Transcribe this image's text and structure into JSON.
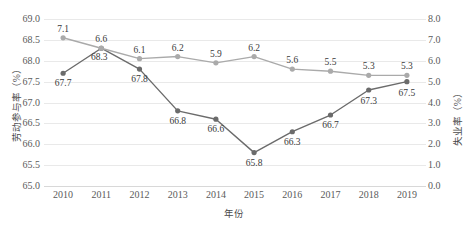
{
  "chart_data": {
    "type": "line",
    "title": "",
    "xlabel": "年份",
    "ylabel": "劳动参与率（%）",
    "y2label": "失业率（%）",
    "categories": [
      "2010",
      "2011",
      "2012",
      "2013",
      "2014",
      "2015",
      "2016",
      "2017",
      "2018",
      "2019"
    ],
    "grid": true,
    "legend": "none",
    "ylim": [
      65.0,
      69.0
    ],
    "ytick_step": 0.5,
    "yticks": [
      "69.0",
      "68.5",
      "68.0",
      "67.5",
      "67.0",
      "66.5",
      "66.0",
      "65.5",
      "65.0"
    ],
    "y2lim": [
      0.0,
      8.0
    ],
    "y2tick_step": 1.0,
    "y2ticks": [
      "8.0",
      "7.0",
      "6.0",
      "5.0",
      "4.0",
      "3.0",
      "2.0",
      "1.0",
      "0.0"
    ],
    "series": [
      {
        "name": "劳动参与率（%）",
        "axis": "left",
        "color": "#6b6b6b",
        "marker": "circle",
        "values": [
          67.7,
          68.3,
          67.8,
          66.8,
          66.6,
          65.8,
          66.3,
          66.7,
          67.3,
          67.5
        ],
        "labels": [
          "67.7",
          "68.3",
          "67.8",
          "66.8",
          "66.6",
          "65.8",
          "66.3",
          "66.7",
          "67.3",
          "67.5"
        ]
      },
      {
        "name": "失业率（%）",
        "axis": "right",
        "color": "#aaaaaa",
        "marker": "circle",
        "values": [
          7.1,
          6.6,
          6.1,
          6.2,
          5.9,
          6.2,
          5.6,
          5.5,
          5.3,
          5.3
        ],
        "labels": [
          "7.1",
          "6.6",
          "6.1",
          "6.2",
          "5.9",
          "6.2",
          "5.6",
          "5.5",
          "5.3",
          "5.3"
        ]
      }
    ]
  }
}
